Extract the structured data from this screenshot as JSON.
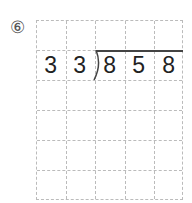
{
  "problem": {
    "number_label": "⑥",
    "divisor": [
      "3",
      "3"
    ],
    "dividend": [
      "8",
      "5",
      "8"
    ]
  },
  "grid": {
    "columns": 5,
    "rows": 6
  }
}
